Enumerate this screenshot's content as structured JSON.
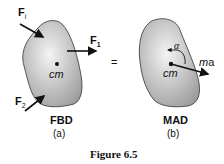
{
  "figure": {
    "caption": "Figure 6.5",
    "equals_sign": "=",
    "panel_a": {
      "title": "FBD",
      "sublabel": "(a)",
      "cm_label": "cm",
      "forces": [
        {
          "name": "F",
          "subscript": "i"
        },
        {
          "name": "F",
          "subscript": "1"
        },
        {
          "name": "F",
          "subscript": "2"
        }
      ]
    },
    "panel_b": {
      "title": "MAD",
      "sublabel": "(b)",
      "cm_label": "cm",
      "alpha_label": "α",
      "ma_m": "m",
      "ma_a": "a"
    }
  },
  "colors": {
    "body_fill_light": "#f2f2f2",
    "body_fill_dark": "#9a9a9a",
    "outline": "#333333",
    "arrow": "#111111"
  }
}
